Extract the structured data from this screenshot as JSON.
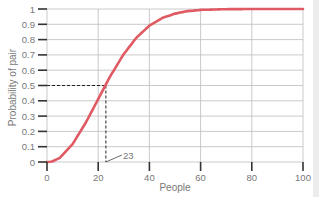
{
  "chart_data": {
    "type": "line",
    "title": "",
    "xlabel": "People",
    "ylabel": "Probability of pair",
    "xlim": [
      0,
      100
    ],
    "ylim": [
      0,
      1
    ],
    "grid": true,
    "legend": null,
    "x_ticks": [
      "0",
      "20",
      "40",
      "60",
      "80",
      "100"
    ],
    "y_ticks": [
      "0",
      "0.1",
      "0.2",
      "0.3",
      "0.4",
      "0.5",
      "0.6",
      "0.7",
      "0.8",
      "0.9",
      "1"
    ],
    "series": [
      {
        "name": "Probability of pair",
        "color": "#e05a63",
        "x": [
          0,
          2,
          5,
          10,
          15,
          20,
          23,
          25,
          30,
          35,
          40,
          45,
          50,
          55,
          60,
          70,
          80,
          90,
          100
        ],
        "y": [
          0,
          0.003,
          0.027,
          0.117,
          0.253,
          0.411,
          0.507,
          0.569,
          0.706,
          0.814,
          0.891,
          0.941,
          0.97,
          0.986,
          0.994,
          0.999,
          1.0,
          1.0,
          1.0
        ]
      }
    ],
    "annotations": [
      {
        "type": "dashed-guide",
        "x": 23,
        "y": 0.5
      },
      {
        "type": "label",
        "text": "23",
        "x": 23,
        "y": 0
      }
    ]
  },
  "colors": {
    "curve": "#e05a63",
    "grid": "#bdbdbd",
    "axis": "#333333",
    "text": "#777777"
  }
}
